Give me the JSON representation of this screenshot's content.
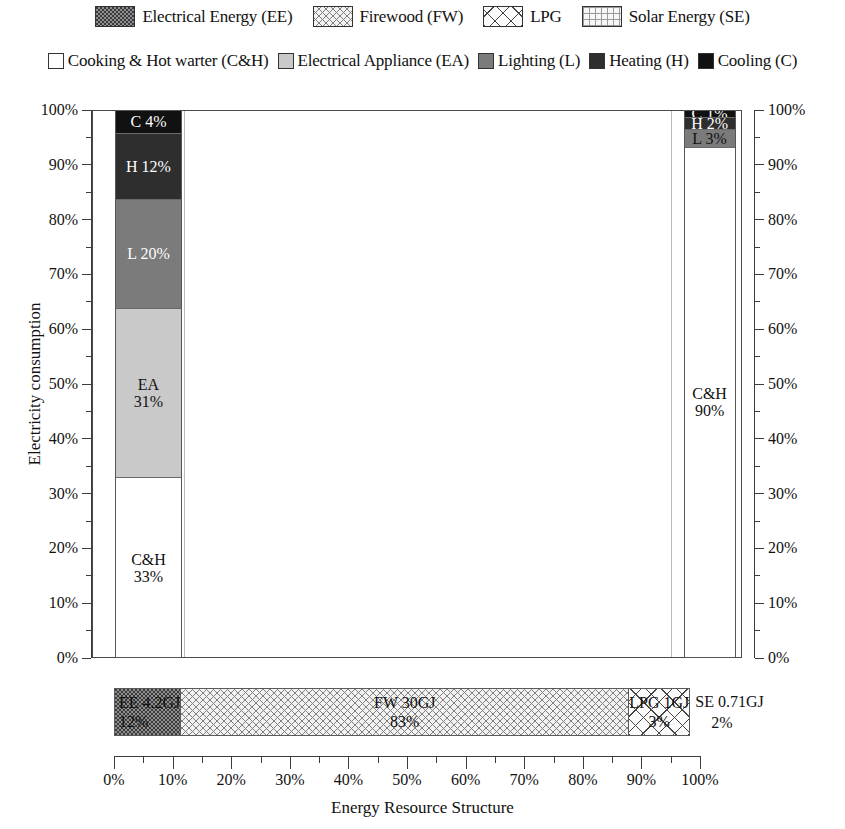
{
  "legend": {
    "row1": [
      {
        "label": "Electrical Energy (EE)",
        "pattern": "dense-dots",
        "key": "EE"
      },
      {
        "label": "Firewood (FW)",
        "pattern": "fine-crosshatch",
        "key": "FW"
      },
      {
        "label": "LPG",
        "pattern": "coarse-diagonal-crosshatch",
        "key": "LPG"
      },
      {
        "label": "Solar Energy (SE)",
        "pattern": "fine-grid",
        "key": "SE"
      }
    ],
    "row2": [
      {
        "label": "Cooking & Hot warter (C&H)",
        "color": "#ffffff",
        "key": "C&H"
      },
      {
        "label": "Electrical Appliance (EA)",
        "color": "#c9c9c9",
        "key": "EA"
      },
      {
        "label": "Lighting (L)",
        "color": "#7b7b7b",
        "key": "L"
      },
      {
        "label": "Heating (H)",
        "color": "#2e2e2e",
        "key": "H"
      },
      {
        "label": "Cooling (C)",
        "color": "#111111",
        "key": "C"
      }
    ]
  },
  "axes": {
    "left_title": "Electricity consumption",
    "right_title": "Energy consumption",
    "bottom_title": "Energy Resource Structure",
    "y_ticks": [
      "100%",
      "90%",
      "80%",
      "70%",
      "60%",
      "50%",
      "40%",
      "30%",
      "20%",
      "10%",
      "0%"
    ],
    "x_ticks": [
      "0%",
      "10%",
      "20%",
      "30%",
      "40%",
      "50%",
      "60%",
      "70%",
      "80%",
      "90%",
      "100%"
    ]
  },
  "chart_data": {
    "type": "bar",
    "subtype": "mosaic-marimekko",
    "title": "",
    "xlabel": "Energy Resource Structure",
    "ylabel": "Electricity consumption",
    "ylabel_right": "Energy consumption",
    "xlim": [
      0,
      100
    ],
    "ylim": [
      0,
      100
    ],
    "grid": false,
    "x_tick_interval": 10,
    "x_minor_tick_interval": 5,
    "resource_bar": {
      "name": "Energy Resource Structure",
      "unit": "GJ",
      "segments": [
        {
          "key": "EE",
          "label": "EE 4.2GJ",
          "amount": 4.2,
          "percent": 12,
          "percent_label": "12%",
          "pattern": "dense-dots"
        },
        {
          "key": "FW",
          "label": "FW 30GJ",
          "amount": 30,
          "percent": 83,
          "percent_label": "83%",
          "pattern": "fine-crosshatch"
        },
        {
          "key": "LPG",
          "label": "LPG 1GJ",
          "amount": 1,
          "percent": 3,
          "percent_label": "3%",
          "pattern": "coarse-diagonal-crosshatch"
        },
        {
          "key": "SE",
          "label": "SE 0.71GJ",
          "amount": 0.71,
          "percent": 2,
          "percent_label": "2%",
          "pattern": "fine-grid"
        }
      ]
    },
    "electricity_bar": {
      "name": "Electricity consumption",
      "aligned_to": "EE",
      "segments": [
        {
          "key": "C",
          "label": "C 4%",
          "name_label": "C",
          "percent": 4,
          "percent_label": "4%",
          "color": "#111111",
          "text": "#ffffff"
        },
        {
          "key": "H",
          "label": "H 12%",
          "name_label": "H",
          "percent": 12,
          "percent_label": "12%",
          "color": "#2e2e2e",
          "text": "#ffffff"
        },
        {
          "key": "L",
          "label": "L 20%",
          "name_label": "L",
          "percent": 20,
          "percent_label": "20%",
          "color": "#7b7b7b",
          "text": "#ffffff"
        },
        {
          "key": "EA",
          "label": "EA",
          "name_label": "EA",
          "percent": 31,
          "percent_label": "31%",
          "color": "#c9c9c9",
          "text": "#111111"
        },
        {
          "key": "C&H",
          "label": "C&H",
          "name_label": "C&H",
          "percent": 33,
          "percent_label": "33%",
          "color": "#ffffff",
          "text": "#111111"
        }
      ]
    },
    "energy_bar": {
      "name": "Energy consumption",
      "aligned_to": "SE",
      "segments": [
        {
          "key": "C",
          "label": "C 1%",
          "name_label": "C",
          "percent": 1,
          "percent_label": "1%",
          "color": "#111111",
          "text": "#ffffff"
        },
        {
          "key": "H",
          "label": "H 2%",
          "name_label": "H",
          "percent": 2,
          "percent_label": "2%",
          "color": "#2e2e2e",
          "text": "#ffffff"
        },
        {
          "key": "L",
          "label": "L 3%",
          "name_label": "L",
          "percent": 3,
          "percent_label": "3%",
          "color": "#7b7b7b",
          "text": "#111111"
        },
        {
          "key": "EA",
          "label": "EA",
          "name_label": "EA",
          "percent": 4,
          "percent_label": "4%",
          "color": "#ffffff",
          "text": "#111111"
        },
        {
          "key": "C&H",
          "label": "C&H",
          "name_label": "C&H",
          "percent": 90,
          "percent_label": "90%",
          "color": "#ffffff",
          "text": "#111111"
        }
      ]
    }
  }
}
